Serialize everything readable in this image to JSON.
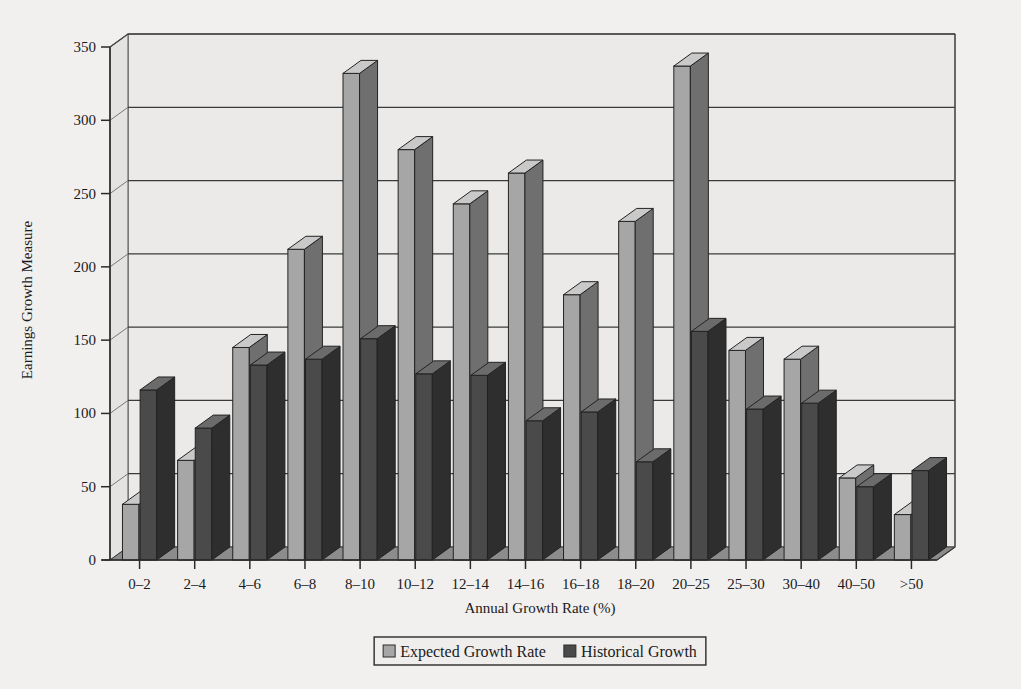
{
  "chart_data": {
    "type": "bar",
    "title": "",
    "subtitle": "",
    "xlabel": "Annual Growth Rate (%)",
    "ylabel": "Earnings Growth Measure",
    "ylim": [
      0,
      350
    ],
    "ytick_step": 50,
    "yticks": [
      "0",
      "50",
      "100",
      "150",
      "200",
      "250",
      "300",
      "350"
    ],
    "ytick_values": [
      0,
      50,
      100,
      150,
      200,
      250,
      300,
      350
    ],
    "grid": true,
    "grid_axis": "y",
    "legend_position": "bottom-center",
    "style": "3d-grouped-bars",
    "categories": [
      "0–2",
      "2–4",
      "4–6",
      "6–8",
      "8–10",
      "10–12",
      "12–14",
      "14–16",
      "16–18",
      "18–20",
      "20–25",
      "25–30",
      "30–40",
      "40–50",
      ">50"
    ],
    "series": [
      {
        "name": "Expected Growth Rate",
        "color": "#a6a6a6",
        "side_color": "#6f6f6f",
        "top_color": "#c9c9c9",
        "values": [
          38,
          68,
          145,
          212,
          332,
          280,
          243,
          264,
          181,
          231,
          337,
          143,
          137,
          56,
          31
        ]
      },
      {
        "name": "Historical Growth",
        "color": "#4a4a4a",
        "side_color": "#2e2e2e",
        "top_color": "#6b6b6b",
        "values": [
          116,
          90,
          133,
          137,
          151,
          127,
          126,
          95,
          101,
          67,
          156,
          103,
          107,
          50,
          61
        ]
      }
    ]
  },
  "legend": {
    "items": [
      {
        "label": "Expected Growth Rate",
        "swatch": "#a6a6a6"
      },
      {
        "label": "Historical Growth",
        "swatch": "#4a4a4a"
      }
    ]
  },
  "axes": {
    "y_title": "Earnings Growth Measure",
    "x_title": "Annual Growth Rate (%)"
  },
  "colors": {
    "background": "#f1f0ee",
    "plot_face": "#ebeae8",
    "plot_floor": "#8c8c8c",
    "axis_line": "#2a2a2a",
    "grid_line": "#3a3a3a"
  }
}
